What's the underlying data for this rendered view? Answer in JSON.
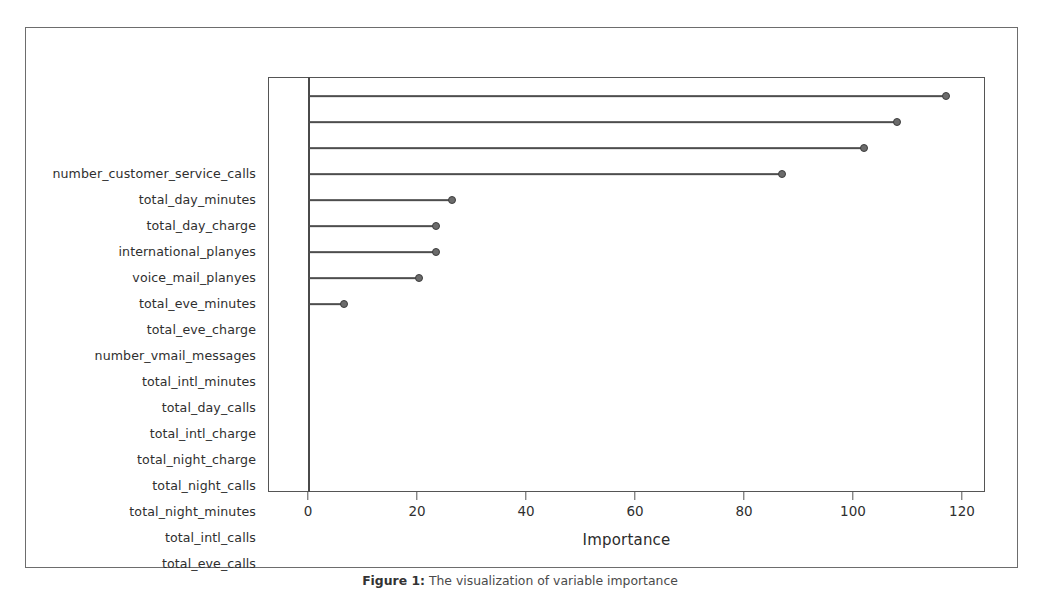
{
  "figure": {
    "caption_prefix": "Figure 1:",
    "caption_text": "The visualization of variable importance"
  },
  "chart_data": {
    "type": "bar",
    "title": "",
    "subtitle": "",
    "xlabel": "Importance",
    "ylabel": "",
    "orientation": "horizontal",
    "style": "lollipop",
    "grid": false,
    "legend": null,
    "xlim": [
      0,
      126
    ],
    "xticks": [
      0,
      20,
      40,
      60,
      80,
      100,
      120
    ],
    "xtick_labels": [
      "0",
      "20",
      "40",
      "60",
      "80",
      "100",
      "120"
    ],
    "categories": [
      "number_customer_service_calls",
      "total_day_minutes",
      "total_day_charge",
      "international_planyes",
      "voice_mail_planyes",
      "total_eve_minutes",
      "total_eve_charge",
      "number_vmail_messages",
      "total_intl_minutes",
      "total_day_calls",
      "total_intl_charge",
      "total_night_charge",
      "total_night_calls",
      "total_night_minutes",
      "total_intl_calls",
      "total_eve_calls"
    ],
    "values": [
      117,
      108,
      102,
      87,
      26.4,
      23.4,
      23.4,
      20.4,
      6.6,
      0,
      0,
      0,
      0,
      0,
      0,
      0
    ],
    "colors": {
      "point": "#6b6b6b",
      "point_edge": "#3d3d3d",
      "stem": "#4d4d4d",
      "axis": "#555555",
      "background": "#ffffff",
      "text": "#2f2f2f"
    }
  }
}
